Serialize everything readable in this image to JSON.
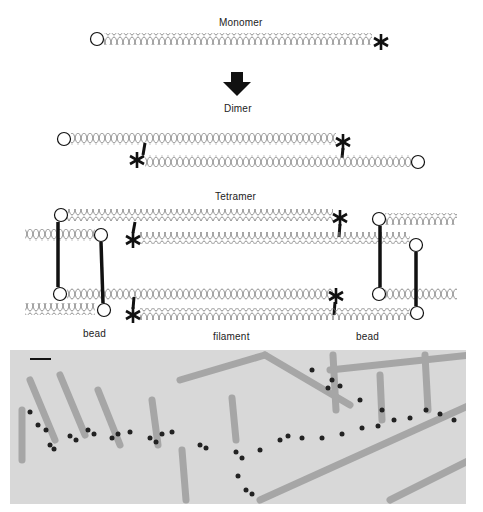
{
  "figure": {
    "stages": [
      {
        "id": "monomer",
        "label": "Monomer"
      },
      {
        "id": "dimer",
        "label": "Dimer"
      },
      {
        "id": "tetramer",
        "label": "Tetramer"
      }
    ],
    "annotations": {
      "bead_left": "bead",
      "filament": "filament",
      "bead_right": "bead"
    },
    "symbols": {
      "head_domain": "circle",
      "tail_domain": "asterisk",
      "coiled_coil": "helix",
      "transition": "down-arrow"
    },
    "micrograph": {
      "description": "Electron micrograph with gold-labelled beads along a filament",
      "scale_bar": true
    },
    "colors": {
      "ink": "#111111",
      "helix": "#777777",
      "micrograph_bg": "#d6d6d6"
    }
  }
}
